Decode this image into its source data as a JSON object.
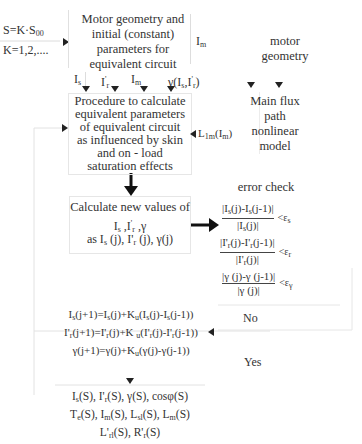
{
  "diagram": {
    "type": "flowchart",
    "loop_input": {
      "line1": "S=K·S",
      "line1_sub": "00",
      "line2": "K=1,2,...."
    },
    "box_geometry": {
      "lines": [
        "Motor geometry and",
        "initial (constant)",
        "parameters for",
        "equivalent circuit"
      ]
    },
    "im_label": "I",
    "im_label_sub": "m",
    "motor_geometry_label": [
      "motor",
      "geometry"
    ],
    "param_labels": {
      "is": "I",
      "is_sub": "s",
      "ir": "I",
      "ir_sup": "'",
      "ir_sub": "r",
      "im": "I",
      "im_sub": "m",
      "gamma": "γ(I",
      "gamma_sub": "s",
      "gamma_mid": ",I",
      "gamma_sup": "'",
      "gamma_sub2": "r",
      "gamma_end": ")"
    },
    "box_procedure": {
      "lines": [
        "Procedure to calculate",
        "equivalent parameters",
        "of equivalent circuit",
        "as influenced by skin",
        "and on - load",
        "saturation effects"
      ]
    },
    "l1m_label": "L",
    "l1m_sub": "1m",
    "l1m_arg": "(I",
    "l1m_arg_sub": "m",
    "l1m_close": ")",
    "main_flux_model": {
      "lines": [
        "Main flux",
        "path",
        "nonlinear",
        "model"
      ]
    },
    "box_calculate": {
      "line1": "Calculate new values of",
      "line2": "I_s ,I'_r ,γ",
      "line3": "as I_s (j), I'_r (j), γ(j)"
    },
    "error_check": {
      "title": "error check",
      "conditions": [
        {
          "numerator": "|I_s(j)-I_s(j-1)|",
          "denominator": "|I_s(j)|",
          "threshold": "<ε_s"
        },
        {
          "numerator": "|I'_r(j)-I'_r(j-1)|",
          "denominator": "|I'_r(j)|",
          "threshold": "<ε_r"
        },
        {
          "numerator": "|γ (j)-γ (j-1)|",
          "denominator": "|γ (j)|",
          "threshold": "<ε_γ"
        }
      ],
      "no_label": "No",
      "yes_label": "Yes"
    },
    "update_equations": [
      "I_s(j+1)=I_s(j)+K_u(I_s(j)-I_s(j-1))",
      "I'_r(j+1)=I'_r(j)+K_u(I'_r(j)-I'_r(j-1))",
      "γ(j+1)=γ(j)+K_u(γ(j)-γ(j-1))"
    ],
    "outputs": {
      "line1": "I_s(S), I'_r(S), γ(S), cosφ(S)",
      "line2": "T_e(S), I_m(S), L_sl(S), L_m(S)",
      "line3": "L'_rl(S), R'_r(S)"
    }
  }
}
